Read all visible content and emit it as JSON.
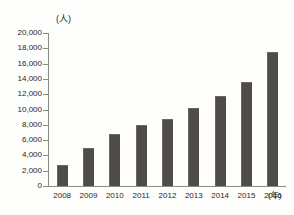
{
  "chart_data": {
    "type": "bar",
    "title": "",
    "subtitle": "",
    "xlabel": "(年)",
    "ylabel": "(人)",
    "categories": [
      "2008",
      "2009",
      "2010",
      "2011",
      "2012",
      "2013",
      "2014",
      "2015",
      "2016"
    ],
    "values": [
      2800,
      5000,
      6800,
      8000,
      8700,
      10200,
      11800,
      13600,
      17500
    ],
    "ylim": [
      0,
      20000
    ],
    "ytick_values": [
      0,
      2000,
      4000,
      6000,
      8000,
      10000,
      12000,
      14000,
      16000,
      18000,
      20000
    ],
    "ytick_labels": [
      "0",
      "2,000",
      "4,000",
      "6,000",
      "8,000",
      "10,000",
      "12,000",
      "14,000",
      "16,000",
      "18,000",
      "20,000"
    ],
    "grid": false,
    "legend": null,
    "series": [
      {
        "name": "人数",
        "values": [
          2800,
          5000,
          6800,
          8000,
          8700,
          10200,
          11800,
          13600,
          17500
        ]
      }
    ],
    "colors": {
      "bar_fill": "#4f4c47",
      "bar_edge": "#6a6760",
      "axis": "#8a8a86",
      "text": "#262626",
      "background": "#fefefc"
    }
  }
}
